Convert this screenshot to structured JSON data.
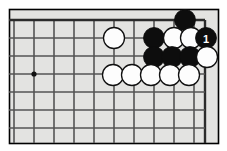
{
  "figure": {
    "kind": "go-board-diagram"
  },
  "colors": {
    "board_fill": "#e3e3e1",
    "board_border": "#000000",
    "grid_line": "#555555",
    "edge_line": "#2b2b2b",
    "black_stone": "#0d0d0d",
    "white_stone": "#fdfdfd",
    "white_stone_outline": "#101010",
    "star_point": "#111111",
    "page_background": "#ffffff",
    "label_on_black": "#ffffff"
  },
  "geometry": {
    "image_width": 227,
    "image_height": 151,
    "board_left": 9,
    "board_top": 9,
    "board_right": 218,
    "board_bottom": 143,
    "grid_origin_x": 14,
    "grid_origin_y": 20,
    "grid_spacing": 20,
    "columns": 11,
    "rows": 7,
    "stone_radius": 10.5,
    "edge_line_width": 2.4,
    "grid_line_width": 1.6
  },
  "grid": {
    "column_x": [
      14,
      34,
      54,
      74,
      94,
      114,
      134,
      154,
      174,
      194,
      205
    ],
    "row_y": [
      20,
      38,
      56,
      74,
      92,
      110,
      128
    ],
    "top_edge_y": 20,
    "right_edge_x": 205
  },
  "star_points": [
    {
      "name": "hoshi-upper-left-area",
      "x": 34,
      "y": 74
    }
  ],
  "stones": [
    {
      "id": "b-top",
      "color": "black",
      "x": 185,
      "y": 20,
      "label": ""
    },
    {
      "id": "w-left-upper",
      "color": "white",
      "x": 114,
      "y": 38,
      "label": ""
    },
    {
      "id": "b-r2-c154",
      "color": "black",
      "x": 154,
      "y": 38,
      "label": ""
    },
    {
      "id": "w-r2-c174",
      "color": "white",
      "x": 174,
      "y": 38,
      "label": ""
    },
    {
      "id": "w-r2-c194",
      "color": "white",
      "x": 191,
      "y": 38,
      "label": ""
    },
    {
      "id": "b-move-1",
      "color": "black",
      "x": 206,
      "y": 38,
      "label": "1"
    },
    {
      "id": "b-r3-c154",
      "color": "black",
      "x": 154,
      "y": 57,
      "label": ""
    },
    {
      "id": "b-r3-c174",
      "color": "black",
      "x": 172,
      "y": 57,
      "label": ""
    },
    {
      "id": "b-r3-c191",
      "color": "black",
      "x": 190,
      "y": 57,
      "label": ""
    },
    {
      "id": "w-r3-right",
      "color": "white",
      "x": 207,
      "y": 57,
      "label": ""
    },
    {
      "id": "w-r4-c114",
      "color": "white",
      "x": 113,
      "y": 75,
      "label": ""
    },
    {
      "id": "w-r4-c133",
      "color": "white",
      "x": 132,
      "y": 75,
      "label": ""
    },
    {
      "id": "w-r4-c152",
      "color": "white",
      "x": 151,
      "y": 75,
      "label": ""
    },
    {
      "id": "w-r4-c171",
      "color": "white",
      "x": 170,
      "y": 75,
      "label": ""
    },
    {
      "id": "w-r4-c190",
      "color": "white",
      "x": 189,
      "y": 75,
      "label": ""
    }
  ],
  "move_markers": [
    {
      "number": "1",
      "color": "black",
      "x": 206,
      "y": 38
    }
  ]
}
